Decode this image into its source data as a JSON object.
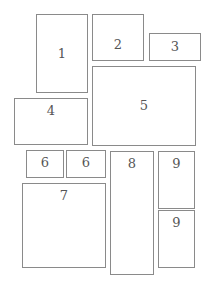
{
  "diagram": {
    "type": "page-layout-blocks",
    "border_color": "#8a8a8a",
    "label_color": "#555555",
    "boxes": [
      {
        "id": "1",
        "label": "1",
        "x": 36,
        "y": 14,
        "w": 52,
        "h": 79,
        "label_pos": "mid"
      },
      {
        "id": "2",
        "label": "2",
        "x": 92,
        "y": 14,
        "w": 52,
        "h": 47,
        "label_pos": "low"
      },
      {
        "id": "3",
        "label": "3",
        "x": 149,
        "y": 33,
        "w": 52,
        "h": 28,
        "label_pos": "mid"
      },
      {
        "id": "4",
        "label": "4",
        "x": 14,
        "y": 98,
        "w": 74,
        "h": 47,
        "label_pos": "top"
      },
      {
        "id": "5",
        "label": "5",
        "x": 92,
        "y": 66,
        "w": 104,
        "h": 80,
        "label_pos": "mid"
      },
      {
        "id": "6a",
        "label": "6",
        "x": 26,
        "y": 150,
        "w": 38,
        "h": 28,
        "label_pos": "top"
      },
      {
        "id": "6b",
        "label": "6",
        "x": 66,
        "y": 150,
        "w": 40,
        "h": 28,
        "label_pos": "top"
      },
      {
        "id": "7",
        "label": "7",
        "x": 22,
        "y": 183,
        "w": 84,
        "h": 85,
        "label_pos": "top"
      },
      {
        "id": "8",
        "label": "8",
        "x": 110,
        "y": 151,
        "w": 44,
        "h": 124,
        "label_pos": "top"
      },
      {
        "id": "9a",
        "label": "9",
        "x": 158,
        "y": 151,
        "w": 37,
        "h": 58,
        "label_pos": "top"
      },
      {
        "id": "9b",
        "label": "9",
        "x": 158,
        "y": 210,
        "w": 37,
        "h": 58,
        "label_pos": "top"
      }
    ]
  }
}
